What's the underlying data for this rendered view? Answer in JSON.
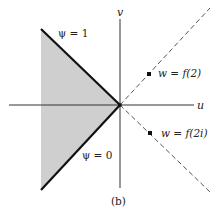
{
  "figure": {
    "caption": "(b)",
    "axes": {
      "horizontal_label": "u",
      "vertical_label": "v",
      "origin": [
        120,
        105
      ]
    },
    "region": {
      "description": "shaded wedge between boundary rays",
      "fill": "#cfcfcf",
      "vertices": [
        [
          41,
          29
        ],
        [
          120,
          105
        ],
        [
          41,
          190
        ]
      ]
    },
    "boundaries": [
      {
        "label": "ψ = 1",
        "from": [
          41,
          29
        ],
        "to": [
          120,
          105
        ]
      },
      {
        "label": "ψ = 0",
        "from": [
          41,
          190
        ],
        "to": [
          120,
          105
        ]
      }
    ],
    "dashed_rays": [
      {
        "from": [
          120,
          105
        ],
        "to": [
          210,
          8
        ]
      },
      {
        "from": [
          120,
          105
        ],
        "to": [
          210,
          192
        ]
      }
    ],
    "points": [
      {
        "label": "w = f(2)",
        "at": [
          149,
          74
        ]
      },
      {
        "label": "w = f(2i)",
        "at": [
          150,
          133
        ]
      }
    ],
    "colors": {
      "ink": "#111111",
      "shade": "#cfcfcf",
      "dashed": "#555555"
    }
  }
}
